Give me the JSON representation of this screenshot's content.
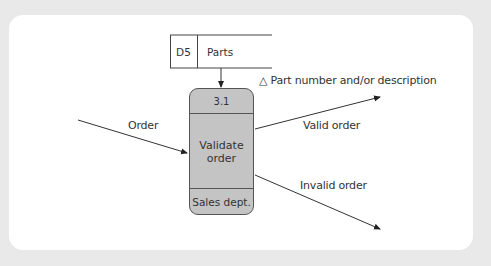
{
  "diagram": {
    "type": "data-flow-diagram",
    "data_store": {
      "id": "D5",
      "name": "Parts"
    },
    "process": {
      "id": "3.1",
      "name": "Validate\norder",
      "owner": "Sales dept."
    },
    "flows": [
      {
        "label": "Order",
        "direction": "in"
      },
      {
        "label": "Valid order",
        "direction": "out"
      },
      {
        "label": "Invalid order",
        "direction": "out"
      }
    ],
    "store_flow_label": "△ Part number and/or description",
    "colors": {
      "process_fill": "#c4c4c4",
      "line": "#333333",
      "frame": "#e9e9e9"
    }
  }
}
